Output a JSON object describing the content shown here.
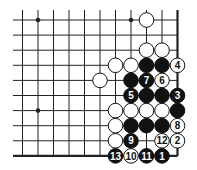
{
  "diagram": {
    "type": "go-board-fragment",
    "corner": "bottom-right",
    "columns": 11,
    "rows": 10,
    "colors": {
      "background": "#ffffff",
      "line": "#222222",
      "black_stone": "#111111",
      "white_stone": "#ffffff",
      "white_label": "#111111",
      "black_label": "#ffffff"
    },
    "star_points": [
      {
        "col": 1,
        "row": 0
      },
      {
        "col": 7,
        "row": 0
      },
      {
        "col": 1,
        "row": 6
      }
    ],
    "stones": [
      {
        "col": 8,
        "row": 0,
        "color": "white",
        "label": ""
      },
      {
        "col": 8,
        "row": 2,
        "color": "white",
        "label": ""
      },
      {
        "col": 9,
        "row": 2,
        "color": "white",
        "label": ""
      },
      {
        "col": 6,
        "row": 3,
        "color": "white",
        "label": ""
      },
      {
        "col": 7,
        "row": 3,
        "color": "white",
        "label": ""
      },
      {
        "col": 8,
        "row": 3,
        "color": "black",
        "label": ""
      },
      {
        "col": 9,
        "row": 3,
        "color": "black",
        "label": ""
      },
      {
        "col": 10,
        "row": 3,
        "color": "white",
        "label": "4"
      },
      {
        "col": 5,
        "row": 4,
        "color": "white",
        "label": ""
      },
      {
        "col": 7,
        "row": 4,
        "color": "black",
        "label": ""
      },
      {
        "col": 8,
        "row": 4,
        "color": "black",
        "label": "7"
      },
      {
        "col": 9,
        "row": 4,
        "color": "white",
        "label": "6"
      },
      {
        "col": 7,
        "row": 5,
        "color": "black",
        "label": "5"
      },
      {
        "col": 8,
        "row": 5,
        "color": "black",
        "label": ""
      },
      {
        "col": 9,
        "row": 5,
        "color": "black",
        "label": ""
      },
      {
        "col": 10,
        "row": 5,
        "color": "black",
        "label": "3"
      },
      {
        "col": 6,
        "row": 6,
        "color": "white",
        "label": ""
      },
      {
        "col": 7,
        "row": 6,
        "color": "white",
        "label": ""
      },
      {
        "col": 8,
        "row": 6,
        "color": "white",
        "label": ""
      },
      {
        "col": 9,
        "row": 6,
        "color": "white",
        "label": ""
      },
      {
        "col": 10,
        "row": 6,
        "color": "black",
        "label": ""
      },
      {
        "col": 6,
        "row": 7,
        "color": "white",
        "label": ""
      },
      {
        "col": 7,
        "row": 7,
        "color": "black",
        "label": ""
      },
      {
        "col": 8,
        "row": 7,
        "color": "black",
        "label": ""
      },
      {
        "col": 9,
        "row": 7,
        "color": "black",
        "label": ""
      },
      {
        "col": 10,
        "row": 7,
        "color": "white",
        "label": "8"
      },
      {
        "col": 6,
        "row": 8,
        "color": "white",
        "label": ""
      },
      {
        "col": 7,
        "row": 8,
        "color": "black",
        "label": "9"
      },
      {
        "col": 9,
        "row": 8,
        "color": "white",
        "label": "12"
      },
      {
        "col": 10,
        "row": 8,
        "color": "white",
        "label": "2"
      },
      {
        "col": 6,
        "row": 9,
        "color": "black",
        "label": "13"
      },
      {
        "col": 7,
        "row": 9,
        "color": "white",
        "label": "10"
      },
      {
        "col": 8,
        "row": 9,
        "color": "black",
        "label": "11"
      },
      {
        "col": 9,
        "row": 9,
        "color": "black",
        "label": "1"
      }
    ]
  }
}
